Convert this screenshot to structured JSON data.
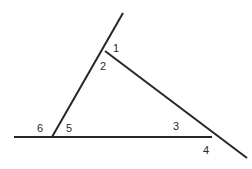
{
  "figure": {
    "width": 252,
    "height": 169,
    "background_color": "#ffffff",
    "stroke_color": "#262626",
    "stroke_width": 2,
    "label_color": "#2b2b2b",
    "label_font_size": 11
  },
  "points": {
    "apex": {
      "name": "apex-vertex",
      "x": 105,
      "y": 51
    },
    "ray_top": {
      "name": "upper-ray-end",
      "x": 123,
      "y": 13
    },
    "left_vertex": {
      "name": "left-base-vertex",
      "x": 52,
      "y": 137
    },
    "right_vertex": {
      "name": "right-base-vertex",
      "x": 212,
      "y": 137
    },
    "baseline_left_end": {
      "name": "baseline-left-end",
      "x": 14,
      "y": 137
    },
    "diagonal_end": {
      "name": "lower-ray-end",
      "x": 247,
      "y": 158
    }
  },
  "segments": [
    {
      "name": "left-side-with-extension",
      "description": "line from upper ray end through apex down to left base vertex",
      "x1": 123,
      "y1": 13,
      "x2": 52,
      "y2": 137
    },
    {
      "name": "right-side-with-extension",
      "description": "line from apex down through right base vertex to lower ray end",
      "x1": 105,
      "y1": 51,
      "x2": 247,
      "y2": 158
    },
    {
      "name": "baseline-with-extension",
      "description": "horizontal line from left end through left vertex to right vertex",
      "x1": 14,
      "y1": 137,
      "x2": 212,
      "y2": 137
    }
  ],
  "labels": [
    {
      "name": "angle-label-1",
      "text": "1",
      "x": 116,
      "y": 48
    },
    {
      "name": "angle-label-2",
      "text": "2",
      "x": 103,
      "y": 66
    },
    {
      "name": "angle-label-3",
      "text": "3",
      "x": 176,
      "y": 126
    },
    {
      "name": "angle-label-4",
      "text": "4",
      "x": 206,
      "y": 150
    },
    {
      "name": "angle-label-5",
      "text": "5",
      "x": 69,
      "y": 128
    },
    {
      "name": "angle-label-6",
      "text": "6",
      "x": 40,
      "y": 128
    }
  ]
}
